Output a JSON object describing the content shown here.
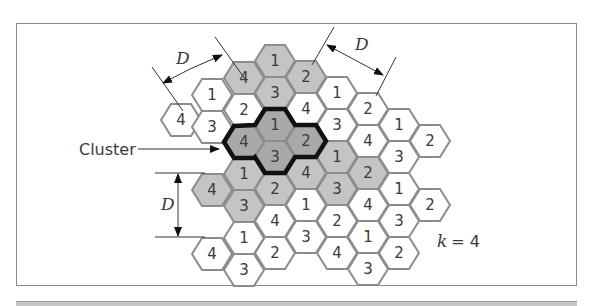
{
  "figure": {
    "cluster_label": "Cluster",
    "reuse_factor_label": "k = 4",
    "reuse_factor_symbol": "k",
    "reuse_factor_value": "4",
    "distance_label": "D",
    "colors": {
      "shaded_cell": "#c4c4c4",
      "cluster_cell": "#a9a9a9",
      "white_cell": "#ffffff",
      "cell_border": "#8c8c8c",
      "cluster_outline": "#111111",
      "line": "#333333"
    }
  },
  "cells": [
    {
      "label": "4",
      "x": 181,
      "y": 120,
      "shade": "white"
    },
    {
      "label": "1",
      "x": 212,
      "y": 95,
      "shade": "white"
    },
    {
      "label": "3",
      "x": 212,
      "y": 127,
      "shade": "white"
    },
    {
      "label": "4",
      "x": 212,
      "y": 190,
      "shade": "gray"
    },
    {
      "label": "4",
      "x": 212,
      "y": 254,
      "shade": "white"
    },
    {
      "label": "4",
      "x": 244,
      "y": 78,
      "shade": "gray"
    },
    {
      "label": "2",
      "x": 244,
      "y": 110,
      "shade": "white"
    },
    {
      "label": "4",
      "x": 244,
      "y": 142,
      "shade": "cluster"
    },
    {
      "label": "1",
      "x": 244,
      "y": 174,
      "shade": "gray"
    },
    {
      "label": "3",
      "x": 244,
      "y": 206,
      "shade": "gray"
    },
    {
      "label": "1",
      "x": 244,
      "y": 238,
      "shade": "white"
    },
    {
      "label": "3",
      "x": 244,
      "y": 270,
      "shade": "white"
    },
    {
      "label": "1",
      "x": 275,
      "y": 61,
      "shade": "gray"
    },
    {
      "label": "3",
      "x": 275,
      "y": 93,
      "shade": "gray"
    },
    {
      "label": "1",
      "x": 275,
      "y": 125,
      "shade": "cluster"
    },
    {
      "label": "3",
      "x": 275,
      "y": 157,
      "shade": "cluster"
    },
    {
      "label": "2",
      "x": 275,
      "y": 189,
      "shade": "gray"
    },
    {
      "label": "4",
      "x": 275,
      "y": 221,
      "shade": "white"
    },
    {
      "label": "2",
      "x": 275,
      "y": 253,
      "shade": "white"
    },
    {
      "label": "2",
      "x": 306,
      "y": 77,
      "shade": "gray"
    },
    {
      "label": "4",
      "x": 306,
      "y": 109,
      "shade": "white"
    },
    {
      "label": "2",
      "x": 306,
      "y": 141,
      "shade": "cluster"
    },
    {
      "label": "4",
      "x": 306,
      "y": 173,
      "shade": "gray"
    },
    {
      "label": "1",
      "x": 306,
      "y": 205,
      "shade": "white"
    },
    {
      "label": "3",
      "x": 306,
      "y": 237,
      "shade": "white"
    },
    {
      "label": "1",
      "x": 337,
      "y": 93,
      "shade": "white"
    },
    {
      "label": "3",
      "x": 337,
      "y": 125,
      "shade": "white"
    },
    {
      "label": "1",
      "x": 337,
      "y": 157,
      "shade": "gray"
    },
    {
      "label": "3",
      "x": 337,
      "y": 189,
      "shade": "gray"
    },
    {
      "label": "2",
      "x": 337,
      "y": 221,
      "shade": "white"
    },
    {
      "label": "4",
      "x": 337,
      "y": 253,
      "shade": "white"
    },
    {
      "label": "2",
      "x": 368,
      "y": 109,
      "shade": "white"
    },
    {
      "label": "4",
      "x": 368,
      "y": 141,
      "shade": "white"
    },
    {
      "label": "2",
      "x": 368,
      "y": 173,
      "shade": "gray"
    },
    {
      "label": "4",
      "x": 368,
      "y": 205,
      "shade": "white"
    },
    {
      "label": "1",
      "x": 368,
      "y": 237,
      "shade": "white"
    },
    {
      "label": "3",
      "x": 368,
      "y": 269,
      "shade": "white"
    },
    {
      "label": "1",
      "x": 399,
      "y": 125,
      "shade": "white"
    },
    {
      "label": "3",
      "x": 399,
      "y": 157,
      "shade": "white"
    },
    {
      "label": "1",
      "x": 399,
      "y": 189,
      "shade": "white"
    },
    {
      "label": "3",
      "x": 399,
      "y": 221,
      "shade": "white"
    },
    {
      "label": "2",
      "x": 399,
      "y": 253,
      "shade": "white"
    },
    {
      "label": "2",
      "x": 430,
      "y": 141,
      "shade": "white"
    },
    {
      "label": "2",
      "x": 430,
      "y": 205,
      "shade": "white"
    }
  ]
}
